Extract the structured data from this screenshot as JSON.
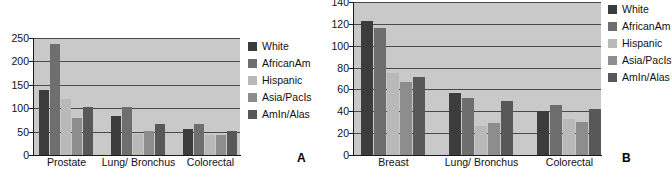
{
  "figure": {
    "panels": [
      {
        "id": "A",
        "label": "A",
        "legend": [
          {
            "name": "White",
            "color": "#3c3c3c"
          },
          {
            "name": "AfricanAm",
            "color": "#6e6e6e"
          },
          {
            "name": "Hispanic",
            "color": "#b9b9b9"
          },
          {
            "name": "Asia/PacIs",
            "color": "#8d8d8d"
          },
          {
            "name": "AmIn/Alas",
            "color": "#585858"
          }
        ]
      },
      {
        "id": "B",
        "label": "B",
        "legend": [
          {
            "name": "White",
            "color": "#3c3c3c"
          },
          {
            "name": "AfricanAm",
            "color": "#6e6e6e"
          },
          {
            "name": "Hispanic",
            "color": "#b9b9b9"
          },
          {
            "name": "Asia/PacIs",
            "color": "#8d8d8d"
          },
          {
            "name": "AmIn/Alas",
            "color": "#585858"
          }
        ]
      }
    ]
  },
  "chart_data": [
    {
      "type": "bar",
      "panel": "A",
      "title": "",
      "xlabel": "",
      "ylabel": "",
      "categories": [
        "Prostate",
        "Lung/ Bronchus",
        "Colorectal"
      ],
      "series": [
        {
          "name": "White",
          "color": "#3c3c3c",
          "values": [
            138,
            84,
            56
          ]
        },
        {
          "name": "AfricanAm",
          "color": "#6e6e6e",
          "values": [
            238,
            102,
            66
          ]
        },
        {
          "name": "Hispanic",
          "color": "#b9b9b9",
          "values": [
            120,
            45,
            42
          ]
        },
        {
          "name": "Asia/PacIs",
          "color": "#8d8d8d",
          "values": [
            79,
            52,
            43
          ]
        },
        {
          "name": "AmIn/Alas",
          "color": "#585858",
          "values": [
            102,
            66,
            52
          ]
        }
      ],
      "ylim": [
        0,
        250
      ],
      "yticks": [
        0,
        50,
        100,
        150,
        200,
        250
      ],
      "grid": true,
      "legend_position": "right"
    },
    {
      "type": "bar",
      "panel": "B",
      "title": "",
      "xlabel": "",
      "ylabel": "",
      "categories": [
        "Breast",
        "Lung/ Bronchus",
        "Colorectal"
      ],
      "series": [
        {
          "name": "White",
          "color": "#3c3c3c",
          "values": [
            123,
            57,
            40
          ]
        },
        {
          "name": "AfricanAm",
          "color": "#6e6e6e",
          "values": [
            116,
            52,
            46
          ]
        },
        {
          "name": "Hispanic",
          "color": "#b9b9b9",
          "values": [
            75,
            27,
            33
          ]
        },
        {
          "name": "Asia/PacIs",
          "color": "#8d8d8d",
          "values": [
            67,
            29,
            30
          ]
        },
        {
          "name": "AmIn/Alas",
          "color": "#585858",
          "values": [
            71,
            49,
            42
          ]
        }
      ],
      "ylim": [
        0,
        140
      ],
      "yticks": [
        0,
        20,
        40,
        60,
        80,
        100,
        120,
        140
      ],
      "grid": true,
      "legend_position": "right"
    }
  ]
}
